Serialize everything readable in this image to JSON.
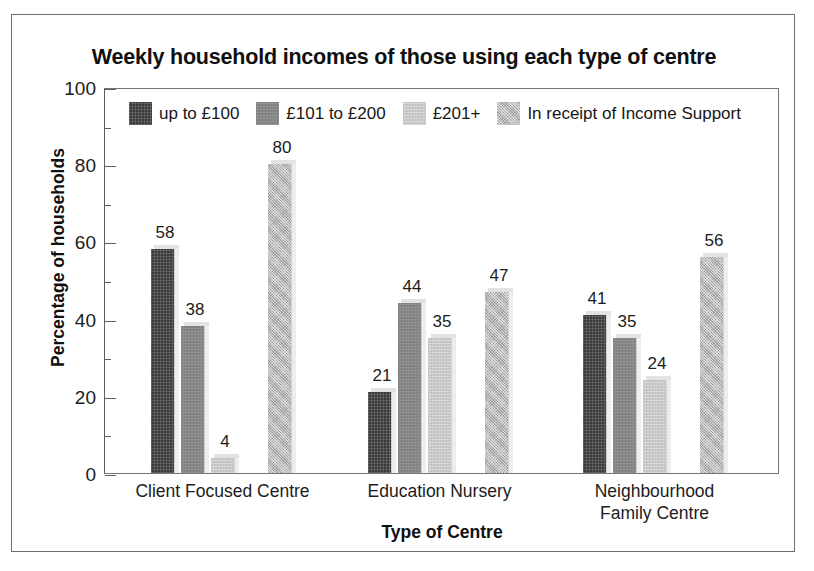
{
  "chart_data": {
    "type": "bar",
    "title": "Weekly household incomes of those using each type of centre",
    "xlabel": "Type of Centre",
    "ylabel": "Percentage of households",
    "ylim": [
      0,
      100
    ],
    "ytick_labels": [
      "0",
      "20",
      "40",
      "60",
      "80",
      "100"
    ],
    "ytick_values": [
      0,
      20,
      40,
      60,
      80,
      100
    ],
    "minor_tick_values": [
      10,
      30,
      50,
      70,
      90
    ],
    "grid": false,
    "legend_position": "top-inside",
    "categories": [
      "Client Focused Centre",
      "Education Nursery",
      "Neighbourhood\nFamily Centre"
    ],
    "category_lines": [
      [
        "Client Focused Centre"
      ],
      [
        "Education Nursery"
      ],
      [
        "Neighbourhood",
        "Family Centre"
      ]
    ],
    "series": [
      {
        "name": "up to £100",
        "color": "#3b3b3b",
        "pattern": "dark-crosshatch",
        "values": [
          58,
          21,
          41
        ]
      },
      {
        "name": "£101 to £200",
        "color": "#878787",
        "pattern": "mid-grey",
        "values": [
          38,
          44,
          35
        ]
      },
      {
        "name": "£201+",
        "color": "#c9c9c9",
        "pattern": "light-grey",
        "values": [
          4,
          35,
          24
        ]
      },
      {
        "name": "In receipt of Income Support",
        "color": "#b5b5b5",
        "pattern": "stipple",
        "values": [
          80,
          47,
          56
        ]
      }
    ]
  }
}
